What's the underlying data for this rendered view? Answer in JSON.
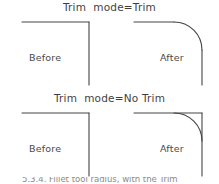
{
  "figure": {
    "background_color": "#ffffff",
    "line_color": "#444444",
    "text_color": "#4a4a4a",
    "width": 219,
    "height": 184
  },
  "panels": [
    {
      "id": "trim",
      "title": "Trim  mode=Trim",
      "before_label": "Before",
      "after_label": "After",
      "before_description": "sharp right-angle corner, two straight lines meeting",
      "after_description": "corner filleted with arc, both lines trimmed back to arc tangent points"
    },
    {
      "id": "no-trim",
      "title": "Trim  mode=No Trim",
      "before_label": "Before",
      "after_label": "After",
      "before_description": "sharp right-angle corner, two straight lines meeting",
      "after_description": "fillet arc added but original corner lines left untrimmed"
    }
  ],
  "caption": {
    "clipped_text": "5.3.4. Fillet tool radius, with the Trim"
  }
}
